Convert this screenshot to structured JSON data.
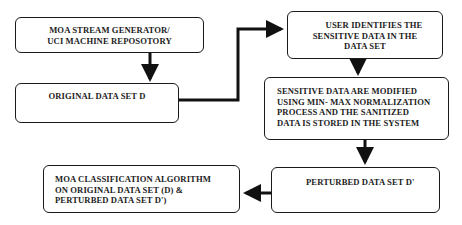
{
  "diagram": {
    "type": "flowchart",
    "nodes": [
      {
        "id": "source",
        "lines": [
          "MOA STREAM GENERATOR/",
          "UCI MACHINE REPOSOTORY"
        ]
      },
      {
        "id": "original",
        "lines": [
          "ORIGINAL DATA SET D"
        ]
      },
      {
        "id": "identify",
        "lines": [
          "USER IDENTIFIES THE",
          "SENSITIVE DATA IN THE",
          "DATA SET"
        ]
      },
      {
        "id": "modify",
        "lines": [
          "SENSITIVE DATA ARE MODIFIED",
          "USING MIN- MAX NORMALIZATION",
          "PROCESS AND THE SANITIZED",
          "DATA IS STORED IN THE SYSTEM"
        ]
      },
      {
        "id": "perturbed",
        "lines": [
          "PERTURBED DATA SET D'"
        ]
      },
      {
        "id": "classify",
        "lines": [
          "MOA CLASSIFICATION ALGORITHM",
          "ON ORIGINAL DATA SET (D) &",
          "PERTURBED DATA SET D')"
        ]
      }
    ],
    "edges": [
      {
        "from": "source",
        "to": "original"
      },
      {
        "from": "original",
        "to": "identify"
      },
      {
        "from": "identify",
        "to": "modify"
      },
      {
        "from": "modify",
        "to": "perturbed"
      },
      {
        "from": "perturbed",
        "to": "classify"
      }
    ],
    "colors": {
      "stroke": "#1a1a1a",
      "background": "#ffffff",
      "text": "#1c1c1c"
    }
  }
}
